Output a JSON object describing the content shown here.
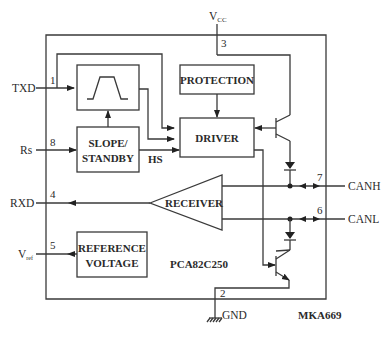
{
  "chip": {
    "part_number": "PCA82C250",
    "figure_code": "MKA669"
  },
  "blocks": {
    "filter": {
      "label": "",
      "icon": "trapezoid-pulse-icon"
    },
    "protection": {
      "label": "PROTECTION"
    },
    "driver": {
      "label": "DRIVER"
    },
    "slope": {
      "label_line1": "SLOPE/",
      "label_line2": "STANDBY"
    },
    "receiver": {
      "label": "RECEIVER"
    },
    "reference": {
      "label_line1": "REFERENCE",
      "label_line2": "VOLTAGE"
    }
  },
  "pins": {
    "txd": {
      "name": "TXD",
      "number": "1"
    },
    "gnd": {
      "name": "GND",
      "number": "2"
    },
    "vcc": {
      "name": "V",
      "sub": "CC",
      "number": "3"
    },
    "rxd": {
      "name": "RXD",
      "number": "4"
    },
    "vref": {
      "name": "V",
      "sub": "ref",
      "number": "5"
    },
    "canl": {
      "name": "CANL",
      "number": "6"
    },
    "canh": {
      "name": "CANH",
      "number": "7"
    },
    "rs": {
      "name": "Rs",
      "number": "8"
    }
  },
  "signals": {
    "hs": "HS"
  }
}
